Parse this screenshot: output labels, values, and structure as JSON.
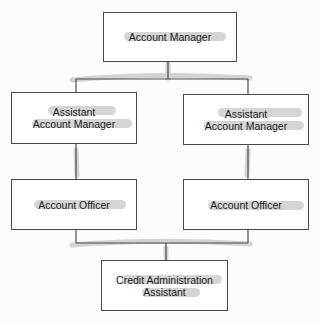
{
  "diagram": {
    "type": "org-chart",
    "nodes": [
      {
        "id": "account-manager",
        "label": "Account Manager"
      },
      {
        "id": "assistant-account-manager-left",
        "label_line1": "Assistant",
        "label_line2": "Account Manager"
      },
      {
        "id": "assistant-account-manager-right",
        "label_line1": "Assistant",
        "label_line2": "Account Manager"
      },
      {
        "id": "account-officer-left",
        "label": "Account Officer"
      },
      {
        "id": "account-officer-right",
        "label": "Account Officer"
      },
      {
        "id": "credit-administration-assistant",
        "label_line1": "Credit Administration",
        "label_line2": "Assistant"
      }
    ],
    "edges": [
      [
        "account-manager",
        "assistant-account-manager-left"
      ],
      [
        "account-manager",
        "assistant-account-manager-right"
      ],
      [
        "assistant-account-manager-left",
        "account-officer-left"
      ],
      [
        "assistant-account-manager-right",
        "account-officer-right"
      ],
      [
        "account-officer-left",
        "credit-administration-assistant"
      ],
      [
        "account-officer-right",
        "credit-administration-assistant"
      ]
    ],
    "colors": {
      "box_border": "#4a4a4a",
      "line": "#555555",
      "highlight": "#c8c8c8"
    }
  }
}
